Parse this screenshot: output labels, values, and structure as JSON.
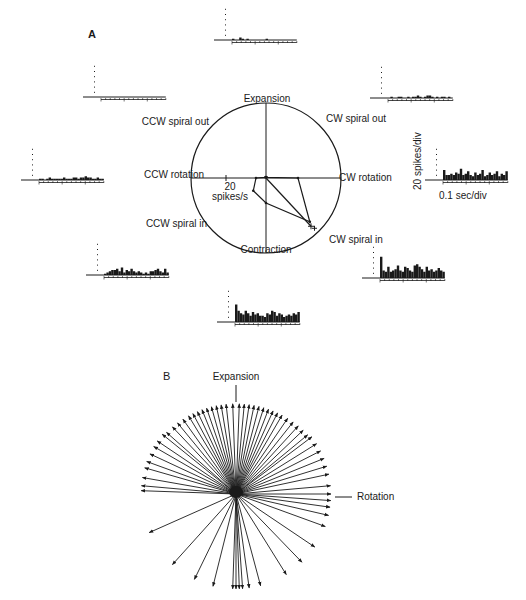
{
  "chart_data": [
    {
      "type": "polar",
      "panel_label": "A",
      "title": "Direction tuning of spiral-space stimuli",
      "directions": [
        "Expansion",
        "CW spiral out",
        "CW rotation",
        "CW spiral in",
        "Contraction",
        "CCW spiral in",
        "CCW rotation",
        "CCW spiral out"
      ],
      "angles_deg": [
        90,
        45,
        0,
        -45,
        -90,
        -135,
        180,
        135
      ],
      "scale_label_value": "20",
      "scale_label_unit": "spikes/s",
      "polygon_values_spikes_per_s": [
        1,
        1,
        32,
        62,
        25,
        18,
        10,
        1
      ],
      "vector_label": "preferred direction",
      "vector_angle_deg": -47,
      "vector_magnitude": 66,
      "circle_radius_spikes_per_s": 75,
      "histograms": [
        {
          "direction": "Expansion",
          "bins": [
            1,
            0,
            0,
            2,
            1,
            0,
            1,
            0,
            0,
            0,
            0,
            0,
            0,
            0,
            1,
            0,
            0,
            0,
            0,
            0,
            0,
            0,
            0,
            0,
            0,
            0,
            0
          ]
        },
        {
          "direction": "CW spiral out",
          "bins": [
            0,
            1,
            0,
            0,
            1,
            1,
            0,
            0,
            1,
            0,
            1,
            1,
            2,
            1,
            0,
            1,
            2,
            2,
            1,
            0,
            1,
            0,
            1,
            1,
            0,
            1,
            0
          ]
        },
        {
          "direction": "CW rotation",
          "bins": [
            8,
            4,
            4,
            5,
            4,
            6,
            5,
            9,
            4,
            5,
            7,
            4,
            3,
            6,
            4,
            5,
            8,
            3,
            4,
            6,
            4,
            5,
            7,
            3,
            5,
            4,
            7
          ]
        },
        {
          "direction": "CW spiral in",
          "bins": [
            17,
            6,
            5,
            9,
            5,
            6,
            7,
            10,
            6,
            5,
            9,
            8,
            6,
            5,
            10,
            11,
            9,
            7,
            5,
            9,
            6,
            7,
            5,
            6,
            8,
            6,
            5
          ]
        },
        {
          "direction": "Contraction",
          "bins": [
            14,
            9,
            7,
            6,
            9,
            7,
            5,
            8,
            6,
            7,
            5,
            5,
            4,
            7,
            6,
            9,
            8,
            5,
            7,
            6,
            4,
            5,
            6,
            5,
            7,
            6,
            8
          ]
        },
        {
          "direction": "CCW spiral in",
          "bins": [
            1,
            2,
            3,
            4,
            4,
            5,
            3,
            6,
            2,
            4,
            3,
            5,
            3,
            2,
            3,
            2,
            1,
            2,
            1,
            3,
            3,
            4,
            5,
            3,
            2,
            5,
            2
          ]
        },
        {
          "direction": "CCW rotation",
          "bins": [
            1,
            1,
            0,
            1,
            2,
            1,
            1,
            1,
            1,
            1,
            2,
            1,
            1,
            1,
            2,
            2,
            1,
            2,
            2,
            3,
            2,
            2,
            1,
            1,
            2,
            1,
            1
          ]
        },
        {
          "direction": "CCW spiral out",
          "bins": [
            0,
            0,
            0,
            0,
            0,
            0,
            0,
            0,
            0,
            0,
            0,
            0,
            0,
            0,
            0,
            0,
            0,
            0,
            0,
            0,
            0,
            0,
            0,
            0,
            0,
            0,
            0
          ]
        }
      ],
      "scale_bar": {
        "y_label": "20 spikes/div",
        "x_label": "0.1 sec/div"
      }
    },
    {
      "type": "vector",
      "panel_label": "B",
      "labels": {
        "up": "Expansion",
        "right": "Rotation"
      },
      "vectors_deg": [
        92,
        96,
        99,
        102,
        105,
        108,
        111,
        114,
        117,
        120,
        88,
        85,
        82,
        79,
        76,
        73,
        70,
        67,
        64,
        61,
        124,
        128,
        132,
        137,
        141,
        146,
        150,
        155,
        160,
        164,
        170,
        175,
        178,
        57,
        53,
        49,
        45,
        41,
        37,
        32,
        27,
        22,
        17,
        12,
        5,
        0,
        -4,
        -8,
        -13,
        -20,
        -34,
        -46,
        -58,
        -75,
        -82,
        -86,
        -88,
        -90,
        -92,
        -104,
        -116,
        -132,
        -156
      ],
      "vectors_len": [
        1,
        1,
        1,
        1,
        1,
        1,
        1,
        1,
        1,
        1,
        1,
        1,
        1,
        1,
        1,
        1,
        1,
        1,
        1,
        1,
        1,
        1,
        1,
        1,
        1,
        1,
        1,
        1,
        1,
        1,
        1,
        1,
        1,
        1,
        1,
        1,
        1,
        1,
        1,
        1,
        1,
        1,
        1,
        1,
        1,
        1,
        1,
        1,
        1,
        1,
        1,
        1,
        1,
        1,
        1,
        1,
        1,
        1,
        1,
        1,
        1,
        1,
        1
      ]
    }
  ]
}
